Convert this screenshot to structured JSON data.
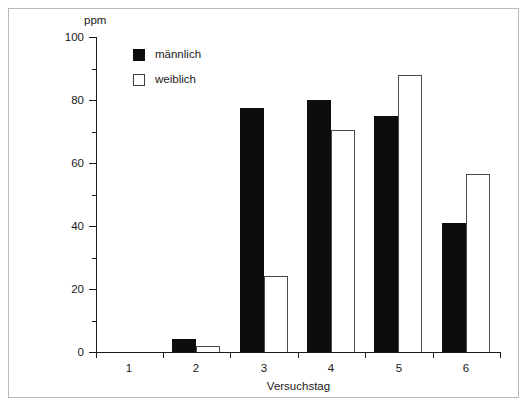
{
  "chart_data": {
    "type": "bar",
    "title": "",
    "xlabel": "Versuchstag",
    "ylabel": "ppm",
    "categories": [
      "1",
      "2",
      "3",
      "4",
      "5",
      "6"
    ],
    "series": [
      {
        "name": "männlich",
        "color": "#0d0d0d",
        "fill": "solid",
        "values": [
          0,
          4,
          77.5,
          80,
          75,
          41
        ]
      },
      {
        "name": "weiblich",
        "color": "#ffffff",
        "fill": "outline",
        "values": [
          0,
          2,
          24,
          70.5,
          88,
          56.5
        ]
      }
    ],
    "ylim": [
      0,
      100
    ],
    "ytick_major": [
      0,
      20,
      40,
      60,
      80,
      100
    ],
    "ytick_minor": [
      10,
      30,
      50,
      70,
      90
    ],
    "ytick_labels": [
      "0",
      "20",
      "40",
      "60",
      "80",
      "100"
    ],
    "grid": false,
    "legend_position": "top-left-inside"
  },
  "legend": {
    "items": [
      {
        "label": "männlich"
      },
      {
        "label": "weiblich"
      }
    ]
  },
  "axes": {
    "y_unit_label": "ppm",
    "x_title": "Versuchstag"
  }
}
